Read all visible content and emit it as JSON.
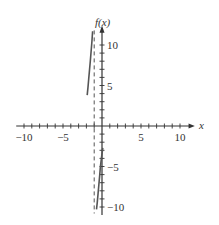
{
  "chart_data": {
    "type": "line",
    "title": "",
    "xlabel": "x",
    "ylabel": "f(x)",
    "xlim": [
      -11,
      11.5
    ],
    "ylim": [
      -11,
      12
    ],
    "x_ticks": [
      -10,
      -5,
      5,
      10
    ],
    "y_ticks": [
      -10,
      -5,
      5,
      10
    ],
    "x_tick_labels": [
      "−10",
      "−5",
      "5",
      "10"
    ],
    "y_tick_labels": [
      "−10",
      "−5",
      "5",
      "10"
    ],
    "minor_tick_step": 1,
    "grid": false,
    "asymptotes": [
      {
        "type": "vertical",
        "x": -1,
        "style": "dashed"
      }
    ],
    "series": [
      {
        "name": "left-branch",
        "x": [
          -1.9,
          -1.8,
          -1.7,
          -1.6,
          -1.5,
          -1.4,
          -1.3,
          -1.2
        ],
        "y": [
          3.8,
          4.8,
          5.8,
          6.9,
          8.0,
          9.2,
          10.4,
          11.7
        ]
      },
      {
        "name": "right-branch",
        "x": [
          0.1,
          -0.05,
          -0.2,
          -0.3,
          -0.4,
          -0.5,
          -0.6,
          -0.7
        ],
        "y": [
          -2.7,
          -3.8,
          -5.0,
          -6.1,
          -7.2,
          -8.3,
          -9.4,
          -10.3
        ]
      }
    ],
    "colors": {
      "axis": "#333333",
      "curve": "#555555",
      "asymptote": "#555555"
    }
  }
}
